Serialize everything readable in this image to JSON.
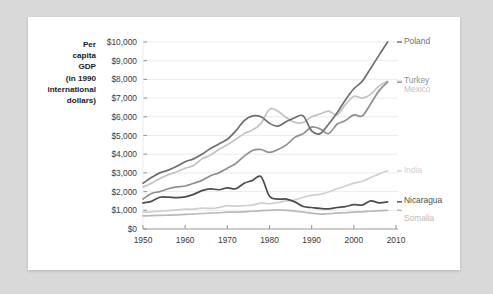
{
  "card": {
    "background_color": "#ffffff",
    "page_background_color": "#d9d9d9"
  },
  "chart_data": {
    "type": "line",
    "title": "",
    "subtitle": "",
    "xlabel": "",
    "ylabel": "Per capita GDP (in 1990 international dollars)",
    "ylabel_lines": [
      "Per",
      "capita",
      "GDP",
      "(in 1990",
      "international",
      "dollars)"
    ],
    "xlim": [
      1950,
      2010
    ],
    "ylim": [
      0,
      10000
    ],
    "grid": true,
    "legend_position": "right-inline-labels",
    "xticks": [
      1950,
      1960,
      1970,
      1980,
      1990,
      2000,
      2010
    ],
    "xtick_labels": [
      "1950",
      "1960",
      "1970",
      "1980",
      "1990",
      "2000",
      "2010"
    ],
    "yticks": [
      0,
      1000,
      2000,
      3000,
      4000,
      5000,
      6000,
      7000,
      8000,
      9000,
      10000
    ],
    "ytick_labels": [
      "$0",
      "$1,000",
      "$2,000",
      "$3,000",
      "$4,000",
      "$5,000",
      "$6,000",
      "$7,000",
      "$8,000",
      "$9,000",
      "$10,000"
    ],
    "x": [
      1950,
      1952,
      1954,
      1956,
      1958,
      1960,
      1962,
      1964,
      1966,
      1968,
      1970,
      1972,
      1974,
      1976,
      1978,
      1980,
      1982,
      1984,
      1986,
      1988,
      1990,
      1992,
      1994,
      1996,
      1998,
      2000,
      2002,
      2004,
      2006,
      2008
    ],
    "series": [
      {
        "name": "Poland",
        "color": "#6e6e6e",
        "label": "Poland",
        "values": [
          2450,
          2750,
          3000,
          3150,
          3350,
          3600,
          3750,
          4000,
          4300,
          4550,
          4800,
          5250,
          5800,
          6050,
          6000,
          5650,
          5500,
          5750,
          5950,
          6050,
          5250,
          5100,
          5600,
          6200,
          6900,
          7500,
          7900,
          8600,
          9300,
          10000
        ]
      },
      {
        "name": "Turkey",
        "color": "#8f8f8f",
        "label": "Turkey",
        "values": [
          1600,
          1900,
          2000,
          2150,
          2250,
          2300,
          2450,
          2600,
          2850,
          3000,
          3250,
          3500,
          3900,
          4200,
          4250,
          4100,
          4250,
          4500,
          4900,
          5100,
          5450,
          5350,
          5100,
          5600,
          5800,
          6100,
          6050,
          6700,
          7400,
          7850
        ]
      },
      {
        "name": "Mexico",
        "color": "#c2c2c2",
        "label": "Mexico",
        "values": [
          2250,
          2450,
          2700,
          2900,
          3050,
          3250,
          3400,
          3750,
          3950,
          4250,
          4500,
          4800,
          5100,
          5300,
          5650,
          6400,
          6300,
          5950,
          5700,
          5700,
          6000,
          6150,
          6300,
          6100,
          6650,
          7100,
          7000,
          7200,
          7650,
          7900
        ]
      },
      {
        "name": "India",
        "color": "#cfcfcf",
        "label": "India",
        "values": [
          900,
          920,
          960,
          980,
          1020,
          1060,
          1060,
          1120,
          1100,
          1150,
          1250,
          1220,
          1250,
          1280,
          1380,
          1350,
          1420,
          1500,
          1550,
          1700,
          1800,
          1850,
          1980,
          2150,
          2300,
          2450,
          2550,
          2750,
          2950,
          3100
        ]
      },
      {
        "name": "Nicaragua",
        "color": "#4d4d4d",
        "label": "Nicaragua",
        "values": [
          1400,
          1480,
          1700,
          1700,
          1680,
          1720,
          1850,
          2050,
          2150,
          2100,
          2200,
          2150,
          2450,
          2600,
          2800,
          1750,
          1600,
          1600,
          1450,
          1200,
          1150,
          1100,
          1080,
          1150,
          1200,
          1300,
          1280,
          1500,
          1400,
          1450
        ]
      },
      {
        "name": "Somalia",
        "color": "#b9b9b9",
        "label": "Somalia",
        "values": [
          700,
          720,
          730,
          740,
          750,
          780,
          800,
          830,
          850,
          870,
          900,
          900,
          920,
          950,
          980,
          1000,
          1020,
          1000,
          960,
          900,
          850,
          800,
          820,
          850,
          870,
          900,
          920,
          950,
          980,
          1000
        ]
      }
    ]
  }
}
